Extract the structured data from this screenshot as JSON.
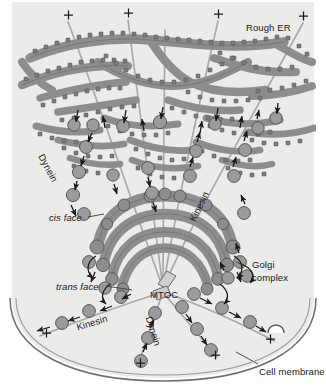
{
  "figure": {
    "background_color": "#ffffff",
    "cytoplasm_color": "#ebebe9",
    "organelle_color": "#8d8d8d",
    "organelle_outline": "#4a4a4a",
    "vesicle_color": "#9b9b9b",
    "microtubule_color": "#a8a8a8",
    "arrow_color": "#1a1a1a",
    "text_color": "#1a1a1a"
  },
  "labels": {
    "rough_er": "Rough ER",
    "dynein_upper": "Dynein",
    "kinesin_upper": "Kinesin",
    "cis_face": "cis face",
    "trans_face": "trans face",
    "golgi_line1": "Golgi",
    "golgi_line2": "complex",
    "mtoc": "MTOC",
    "kinesin_lower": "Kinesin",
    "dynein_lower": "Dynein",
    "cell_membrane": "Cell membrane",
    "plus_sign": "+"
  },
  "plus_ends": [
    {
      "id": "plus-top-1",
      "x": 68,
      "y": 15
    },
    {
      "id": "plus-top-2",
      "x": 128,
      "y": 13
    },
    {
      "id": "plus-top-3",
      "x": 218,
      "y": 14
    },
    {
      "id": "plus-top-4",
      "x": 303,
      "y": 16
    },
    {
      "id": "plus-bottom-left",
      "x": 46,
      "y": 333
    },
    {
      "id": "plus-bottom-center",
      "x": 140,
      "y": 363
    },
    {
      "id": "plus-bottom-mid",
      "x": 215,
      "y": 355
    },
    {
      "id": "plus-bottom-right",
      "x": 270,
      "y": 339
    }
  ],
  "structures": {
    "rough_er": {
      "name": "Rough endoplasmic reticulum",
      "description": "Branching tubular network studded with ribosomes",
      "ribosome_count_visible": 120
    },
    "golgi_complex": {
      "name": "Golgi complex",
      "cisternae": 4,
      "faces": [
        "cis face",
        "trans face"
      ]
    },
    "mtoc": {
      "name": "Microtubule organizing center",
      "abbreviation": "MTOC",
      "contains": "centriole pair"
    },
    "cell_membrane": {
      "name": "Cell membrane",
      "style": "double arc at cell periphery"
    }
  },
  "motors": {
    "dynein": {
      "name": "Dynein",
      "direction": "minus-end directed",
      "occurrences": 2
    },
    "kinesin": {
      "name": "Kinesin",
      "direction": "plus-end directed",
      "occurrences": 2
    }
  }
}
